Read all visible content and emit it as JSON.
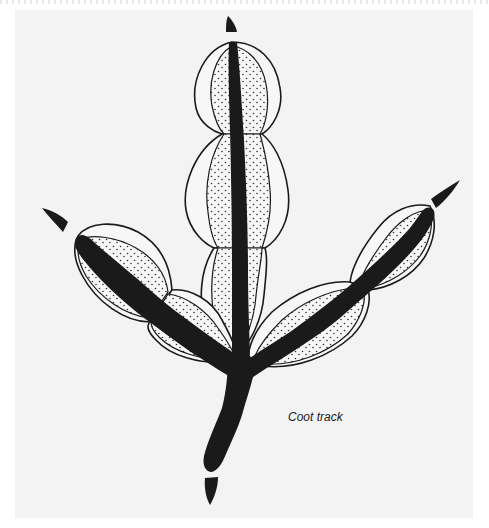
{
  "figure": {
    "caption": "Coot track",
    "colors": {
      "background": "#f3f3f3",
      "ink": "#1a1a1a",
      "lobe_fill": "#f7f7f7"
    },
    "parts": {
      "toes": [
        "left-toe",
        "middle-toe",
        "right-toe"
      ],
      "hind_toe": "heel",
      "claws": [
        "left-claw",
        "middle-claw",
        "right-claw",
        "hind-claw"
      ]
    }
  }
}
